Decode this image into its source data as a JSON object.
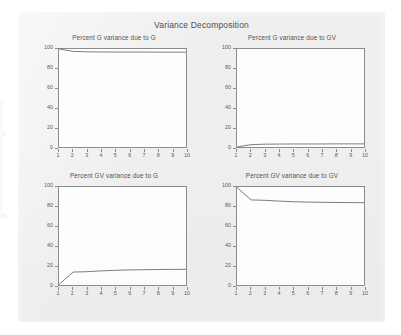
{
  "figure": {
    "title": "Variance Decomposition",
    "background_color": "#efefef",
    "frame_color": "#8c8c8c",
    "line_color": "#6e6e6e"
  },
  "chart_data": [
    {
      "type": "line",
      "title": "Percent G variance due to G",
      "xlabel": "",
      "ylabel": "",
      "x": [
        1,
        2,
        3,
        4,
        5,
        6,
        7,
        8,
        9,
        10
      ],
      "values": [
        100,
        97.6,
        97.1,
        97.0,
        96.9,
        96.9,
        96.9,
        96.8,
        96.8,
        96.8
      ],
      "xlim": [
        1,
        10
      ],
      "ylim": [
        0,
        100
      ],
      "xticks": [
        1,
        2,
        3,
        4,
        5,
        6,
        7,
        8,
        9,
        10
      ],
      "yticks": [
        0,
        20,
        40,
        60,
        80,
        100
      ],
      "grid": false,
      "legend": "none"
    },
    {
      "type": "line",
      "title": "Percent G variance due to GV",
      "xlabel": "",
      "ylabel": "",
      "x": [
        1,
        2,
        3,
        4,
        5,
        6,
        7,
        8,
        9,
        10
      ],
      "values": [
        0,
        2.4,
        2.9,
        3.0,
        3.1,
        3.1,
        3.1,
        3.2,
        3.2,
        3.2
      ],
      "xlim": [
        1,
        10
      ],
      "ylim": [
        0,
        100
      ],
      "xticks": [
        1,
        2,
        3,
        4,
        5,
        6,
        7,
        8,
        9,
        10
      ],
      "yticks": [
        0,
        20,
        40,
        60,
        80,
        100
      ],
      "grid": false,
      "legend": "none"
    },
    {
      "type": "line",
      "title": "Percent GV variance due to G",
      "xlabel": "",
      "ylabel": "",
      "x": [
        1,
        2,
        3,
        4,
        5,
        6,
        7,
        8,
        9,
        10
      ],
      "values": [
        0.5,
        13.2,
        13.6,
        14.4,
        15.0,
        15.4,
        15.6,
        15.8,
        15.9,
        16.0
      ],
      "xlim": [
        1,
        10
      ],
      "ylim": [
        0,
        100
      ],
      "xticks": [
        1,
        2,
        3,
        4,
        5,
        6,
        7,
        8,
        9,
        10
      ],
      "yticks": [
        0,
        20,
        40,
        60,
        80,
        100
      ],
      "grid": false,
      "legend": "none"
    },
    {
      "type": "line",
      "title": "Percent GV variance due to GV",
      "xlabel": "",
      "ylabel": "",
      "x": [
        1,
        2,
        3,
        4,
        5,
        6,
        7,
        8,
        9,
        10
      ],
      "values": [
        99.5,
        86.8,
        86.4,
        85.6,
        85.0,
        84.6,
        84.4,
        84.2,
        84.1,
        84.0
      ],
      "xlim": [
        1,
        10
      ],
      "ylim": [
        0,
        100
      ],
      "xticks": [
        1,
        2,
        3,
        4,
        5,
        6,
        7,
        8,
        9,
        10
      ],
      "yticks": [
        0,
        20,
        40,
        60,
        80,
        100
      ],
      "grid": false,
      "legend": "none"
    }
  ]
}
